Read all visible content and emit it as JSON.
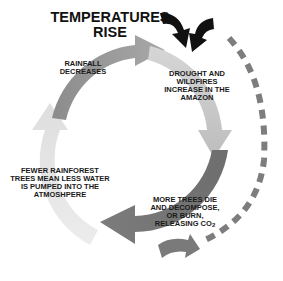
{
  "diagram": {
    "title": "TEMPERATURES RISE",
    "nodes": [
      {
        "id": "rainfall",
        "label": "RAINFALL DECREASES"
      },
      {
        "id": "drought",
        "label": "DROUGHT AND WILDFIRES INCREASE IN THE AMAZON"
      },
      {
        "id": "trees",
        "label_main": "MORE TREES DIE AND DECOMPOSE, OR BURN, RELEASING CO",
        "label_sub": "2"
      },
      {
        "id": "fewer",
        "label": "FEWER RAINFOREST TREES MEAN LESS WATER IS PUMPED INTO THE ATMOSHPERE"
      }
    ],
    "edges": [
      {
        "from": "rainfall",
        "to": "drought",
        "style": "solid-arrow"
      },
      {
        "from": "drought",
        "to": "trees",
        "style": "solid-arrow"
      },
      {
        "from": "trees",
        "to": "fewer",
        "style": "solid-arrow"
      },
      {
        "from": "fewer",
        "to": "rainfall",
        "style": "solid-arrow"
      },
      {
        "from": "trees",
        "to": "title",
        "style": "dashed-feedback"
      }
    ],
    "colors": {
      "arc_dark": "#7a7a7a",
      "arc_mid": "#9a9a9a",
      "arc_light": "#c8c8c8",
      "arc_pale": "#e4e4e4",
      "black_arrows": "#111111",
      "dashed": "#7d7d7d"
    }
  }
}
